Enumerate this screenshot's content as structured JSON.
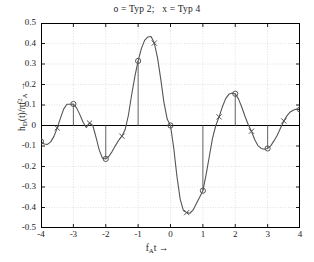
{
  "chart_data": {
    "type": "line",
    "title": "o = Typ 2;   x = Typ 4",
    "xlabel": "f_A t →",
    "ylabel": "h_D(t)/πf_A² →",
    "xlim": [
      -4,
      4
    ],
    "ylim": [
      -0.5,
      0.5
    ],
    "xticks": [
      "-4",
      "-3",
      "-2",
      "-1",
      "0",
      "1",
      "2",
      "3",
      "4"
    ],
    "xtick_values": [
      -4,
      -3,
      -2,
      -1,
      0,
      1,
      2,
      3,
      4
    ],
    "ytick_values": [
      0.5,
      0.4,
      0.3,
      0.2,
      0.1,
      0,
      -0.1,
      -0.2,
      -0.3,
      -0.4,
      -0.5
    ],
    "yticks": [
      "0.5",
      "0.4",
      "0.3",
      "0.2",
      "0.1",
      "0",
      "-0.1",
      "-0.2",
      "-0.3",
      "-0.4",
      "-0.5"
    ],
    "grid": true,
    "legend": "none",
    "line_color": "#555555",
    "marker_color": "#555555",
    "stem_color": "#666666",
    "axis_color": "#000000",
    "grid_color": "#cccccc",
    "series": [
      {
        "name": "Typ 2",
        "marker": "o",
        "comment": "circle markers at integer f_A t with stem lines to zero axis",
        "x": [
          -4,
          -3,
          -2,
          -1,
          0,
          1,
          2,
          3,
          4
        ],
        "values": [
          -0.078,
          0.105,
          -0.163,
          0.315,
          0.0,
          -0.318,
          0.155,
          -0.112,
          0.078
        ]
      },
      {
        "name": "Typ 4",
        "marker": "x",
        "comment": "cross markers at half-integer f_A t",
        "x": [
          -3.5,
          -2.5,
          -1.5,
          -0.5,
          0.5,
          1.5,
          2.5,
          3.5
        ],
        "values": [
          -0.012,
          0.012,
          -0.052,
          0.402,
          -0.425,
          0.042,
          -0.028,
          0.022
        ]
      }
    ],
    "curve": {
      "name": "continuous interpolation",
      "x": [
        -4.0,
        -3.9,
        -3.8,
        -3.7,
        -3.6,
        -3.5,
        -3.4,
        -3.3,
        -3.2,
        -3.1,
        -3.0,
        -2.9,
        -2.8,
        -2.7,
        -2.6,
        -2.5,
        -2.4,
        -2.3,
        -2.2,
        -2.1,
        -2.0,
        -1.9,
        -1.8,
        -1.7,
        -1.6,
        -1.5,
        -1.4,
        -1.3,
        -1.2,
        -1.1,
        -1.0,
        -0.9,
        -0.8,
        -0.7,
        -0.6,
        -0.5,
        -0.4,
        -0.3,
        -0.2,
        -0.1,
        0.0,
        0.1,
        0.2,
        0.3,
        0.4,
        0.5,
        0.6,
        0.7,
        0.8,
        0.9,
        1.0,
        1.1,
        1.2,
        1.3,
        1.4,
        1.5,
        1.6,
        1.7,
        1.8,
        1.9,
        2.0,
        2.1,
        2.2,
        2.3,
        2.4,
        2.5,
        2.6,
        2.7,
        2.8,
        2.9,
        3.0,
        3.1,
        3.2,
        3.3,
        3.4,
        3.5,
        3.6,
        3.7,
        3.8,
        3.9,
        4.0
      ],
      "y": [
        -0.078,
        -0.09,
        -0.092,
        -0.08,
        -0.053,
        -0.012,
        0.036,
        0.08,
        0.104,
        0.104,
        0.105,
        0.086,
        0.053,
        0.016,
        -0.01,
        0.012,
        0.0,
        -0.058,
        -0.12,
        -0.16,
        -0.163,
        -0.15,
        -0.126,
        -0.098,
        -0.072,
        -0.052,
        -0.02,
        0.05,
        0.15,
        0.24,
        0.315,
        0.375,
        0.415,
        0.432,
        0.434,
        0.402,
        0.33,
        0.225,
        0.11,
        0.03,
        0.0,
        -0.11,
        -0.25,
        -0.36,
        -0.415,
        -0.425,
        -0.428,
        -0.412,
        -0.38,
        -0.35,
        -0.318,
        -0.24,
        -0.15,
        -0.06,
        0.0,
        0.042,
        0.09,
        0.13,
        0.152,
        0.158,
        0.155,
        0.13,
        0.09,
        0.045,
        0.005,
        -0.028,
        -0.068,
        -0.098,
        -0.112,
        -0.116,
        -0.112,
        -0.098,
        -0.074,
        -0.046,
        -0.012,
        0.022,
        0.048,
        0.066,
        0.076,
        0.08,
        0.078
      ]
    }
  }
}
